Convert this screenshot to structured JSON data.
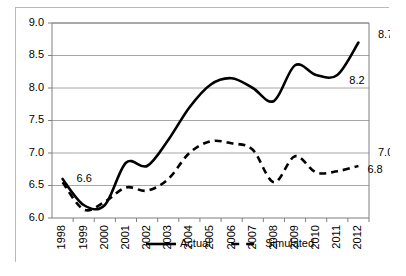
{
  "chart_data": {
    "type": "line",
    "title": "",
    "subtitle": "",
    "xlabel": "",
    "ylabel": "",
    "categories": [
      "1998",
      "1999",
      "2000",
      "2001",
      "2002",
      "2003",
      "2004",
      "2005",
      "2006",
      "2007",
      "2008",
      "2009",
      "2010",
      "2011",
      "2012"
    ],
    "ylim": [
      6.0,
      9.0
    ],
    "yticks": [
      "6.0",
      "6.5",
      "7.0",
      "7.5",
      "8.0",
      "8.5",
      "9.0"
    ],
    "ytick_values": [
      6.0,
      6.5,
      7.0,
      7.5,
      8.0,
      8.5,
      9.0
    ],
    "grid": true,
    "legend_position": "bottom",
    "series": [
      {
        "name": "Actual",
        "style": "solid",
        "color": "#000000",
        "values": [
          6.6,
          6.2,
          6.2,
          6.85,
          6.8,
          7.2,
          7.7,
          8.05,
          8.15,
          8.0,
          7.8,
          8.35,
          8.2,
          8.2,
          8.7
        ]
      },
      {
        "name": "Simulated",
        "style": "dashed",
        "color": "#000000",
        "values": [
          6.55,
          6.13,
          6.25,
          6.47,
          6.42,
          6.6,
          7.0,
          7.18,
          7.15,
          7.05,
          6.55,
          6.95,
          6.7,
          6.72,
          6.8
        ]
      }
    ],
    "annotations": [
      {
        "id": "start-actual",
        "text": "6.6",
        "series": "Actual",
        "x_index": 0,
        "value": 6.6
      },
      {
        "id": "plateau-actual",
        "text": "8.2",
        "series": "Actual",
        "x_index": 13,
        "value": 8.2
      },
      {
        "id": "end-actual",
        "text": "8.7",
        "series": "Actual",
        "x_index": 14,
        "value": 8.7
      },
      {
        "id": "right-ref",
        "text": "7.0",
        "series": "axis",
        "x_index": 14,
        "value": 7.0
      },
      {
        "id": "end-sim",
        "text": "6.8",
        "series": "Simulated",
        "x_index": 14,
        "value": 6.8
      }
    ]
  },
  "legend": {
    "items": [
      {
        "label": "Actual",
        "style": "solid"
      },
      {
        "label": "Simulated",
        "style": "dashed"
      }
    ]
  }
}
